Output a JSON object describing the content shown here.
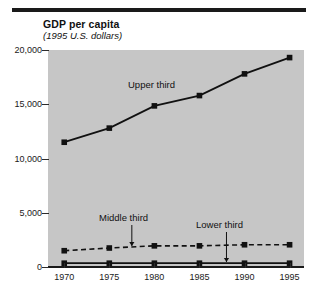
{
  "figure": {
    "title": "GDP per capita",
    "subtitle": "(1995 U.S. dollars)",
    "background": "#c6c6c6",
    "ink": "#1a1a1a"
  },
  "chart_data": {
    "type": "line",
    "title": "GDP per capita",
    "subtitle": "(1995 U.S. dollars)",
    "xlabel": "",
    "ylabel": "",
    "x": [
      1970,
      1975,
      1980,
      1985,
      1990,
      1995
    ],
    "xtick_labels": [
      "1970",
      "1975",
      "1980",
      "1985",
      "1990",
      "1995"
    ],
    "ytick_labels": [
      "0",
      "5,000",
      "10,000",
      "15,000",
      "20,000"
    ],
    "yticks": [
      0,
      5000,
      10000,
      15000,
      20000
    ],
    "ylim": [
      0,
      20000
    ],
    "xlim": [
      1968.2,
      1996.6
    ],
    "grid": false,
    "legend": "in-plot annotations with arrows",
    "series": [
      {
        "name": "Upper third",
        "style": "solid",
        "marker": "square",
        "color": "#111111",
        "values": [
          11500,
          12800,
          14850,
          15800,
          17800,
          19300
        ]
      },
      {
        "name": "Middle third",
        "style": "dashed",
        "marker": "square",
        "color": "#111111",
        "values": [
          1500,
          1750,
          1950,
          1950,
          2050,
          2050
        ]
      },
      {
        "name": "Lower third",
        "style": "solid",
        "marker": "square",
        "color": "#111111",
        "values": [
          350,
          350,
          350,
          350,
          350,
          350
        ]
      }
    ],
    "annotations": [
      {
        "text": "Upper third",
        "arrow": false
      },
      {
        "text": "Middle third",
        "arrow": true,
        "points_to": "Middle third series at 1977.5"
      },
      {
        "text": "Lower third",
        "arrow": true,
        "points_to": "Lower third series at 1988"
      }
    ]
  }
}
